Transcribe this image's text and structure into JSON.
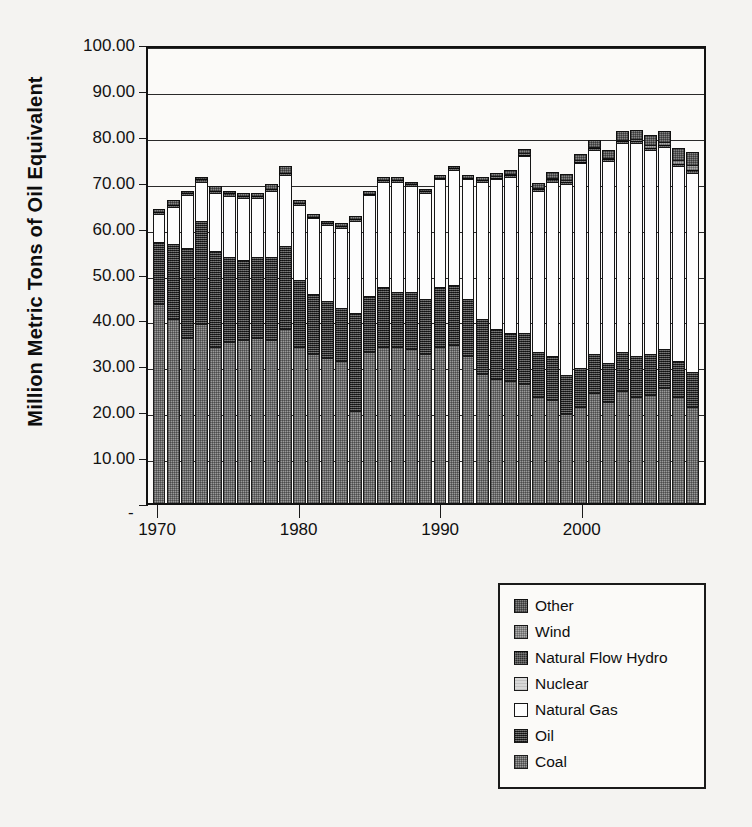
{
  "chart_data": {
    "type": "bar",
    "title": "",
    "subtitle": "",
    "stacked": true,
    "xlabel": "",
    "ylabel": "Million Metric Tons of Oil Equivalent",
    "ylim": [
      0,
      100
    ],
    "ytick_labels": [
      "100.00",
      "90.00",
      "80.00",
      "70.00",
      "60.00",
      "50.00",
      "40.00",
      "30.00",
      "20.00",
      "10.00",
      "-"
    ],
    "ytick_values": [
      100,
      90,
      80,
      70,
      60,
      50,
      40,
      30,
      20,
      10,
      0
    ],
    "grid": "horizontal",
    "legend_position": "below-right",
    "xtick_labels": [
      "1970",
      "1980",
      "1990",
      "2000"
    ],
    "xtick_values": [
      1970,
      1980,
      1990,
      2000
    ],
    "categories": [
      1970,
      1971,
      1972,
      1973,
      1974,
      1975,
      1976,
      1977,
      1978,
      1979,
      1980,
      1981,
      1982,
      1983,
      1984,
      1985,
      1986,
      1987,
      1988,
      1989,
      1990,
      1991,
      1992,
      1993,
      1994,
      1995,
      1996,
      1997,
      1998,
      1999,
      2000,
      2001,
      2002,
      2003,
      2004,
      2005,
      2006,
      2007,
      2008
    ],
    "series": [
      {
        "name": "Coal",
        "color": "#9a9a9a",
        "values": [
          43.4,
          40.0,
          36.0,
          39.0,
          34.0,
          35.0,
          35.5,
          36.0,
          35.5,
          38.0,
          34.0,
          32.5,
          31.5,
          31.0,
          20.0,
          33.0,
          34.0,
          34.0,
          33.5,
          32.5,
          34.0,
          34.5,
          32.0,
          28.0,
          27.0,
          26.5,
          26.0,
          23.0,
          22.5,
          19.5,
          21.0,
          24.0,
          22.0,
          24.5,
          23.0,
          23.5,
          25.0,
          23.0,
          21.0
        ]
      },
      {
        "name": "Oil",
        "color": "#4a4a4a",
        "values": [
          13.5,
          16.5,
          19.5,
          22.5,
          21.0,
          18.5,
          17.5,
          17.5,
          18.0,
          18.0,
          14.5,
          13.0,
          12.5,
          11.5,
          21.5,
          12.0,
          13.0,
          12.0,
          12.5,
          12.0,
          13.0,
          13.0,
          12.5,
          12.0,
          11.0,
          10.5,
          11.0,
          10.0,
          9.5,
          8.5,
          8.5,
          8.5,
          8.5,
          8.5,
          9.0,
          9.0,
          8.5,
          8.0,
          7.5
        ]
      },
      {
        "name": "Natural Gas",
        "color": "#fdfdfd",
        "values": [
          6.0,
          8.0,
          11.5,
          8.5,
          12.5,
          13.5,
          13.5,
          13.0,
          14.5,
          15.5,
          16.5,
          16.5,
          16.5,
          17.5,
          20.0,
          22.0,
          23.0,
          24.0,
          23.0,
          23.0,
          23.5,
          25.0,
          26.0,
          30.0,
          32.5,
          34.0,
          38.5,
          35.0,
          38.0,
          41.5,
          44.5,
          44.5,
          44.0,
          45.5,
          46.5,
          44.5,
          44.0,
          42.5,
          43.5
        ]
      },
      {
        "name": "Nuclear",
        "color": "#d8d8d8",
        "values": [
          0.0,
          0.0,
          0.0,
          0.0,
          0.0,
          0.0,
          0.0,
          0.0,
          0.0,
          0.0,
          0.0,
          0.0,
          0.0,
          0.0,
          0.0,
          0.0,
          0.0,
          0.0,
          0.0,
          0.0,
          0.0,
          0.0,
          0.0,
          0.0,
          0.0,
          0.0,
          0.0,
          0.0,
          0.0,
          0.0,
          0.0,
          0.0,
          0.0,
          0.0,
          0.0,
          0.0,
          0.0,
          0.0,
          0.0
        ]
      },
      {
        "name": "Natural Flow Hydro",
        "color": "#2c2c2c",
        "values": [
          0.5,
          0.5,
          0.5,
          0.5,
          0.5,
          0.5,
          0.4,
          0.5,
          0.5,
          0.5,
          0.4,
          0.4,
          0.4,
          0.4,
          0.4,
          0.4,
          0.4,
          0.4,
          0.4,
          0.4,
          0.4,
          0.4,
          0.4,
          0.4,
          0.4,
          0.4,
          0.3,
          0.4,
          0.5,
          0.5,
          0.4,
          0.3,
          0.4,
          0.3,
          0.4,
          0.4,
          0.4,
          0.4,
          0.5
        ]
      },
      {
        "name": "Wind",
        "color": "#adadad",
        "values": [
          0.0,
          0.0,
          0.0,
          0.0,
          0.0,
          0.0,
          0.0,
          0.0,
          0.0,
          0.0,
          0.0,
          0.0,
          0.0,
          0.0,
          0.0,
          0.0,
          0.0,
          0.0,
          0.0,
          0.0,
          0.0,
          0.0,
          0.0,
          0.0,
          0.1,
          0.1,
          0.1,
          0.1,
          0.2,
          0.2,
          0.2,
          0.2,
          0.3,
          0.3,
          0.4,
          0.5,
          0.7,
          0.9,
          1.2
        ]
      },
      {
        "name": "Other",
        "color": "#848484",
        "values": [
          0.6,
          1.0,
          0.5,
          0.5,
          1.0,
          0.5,
          0.6,
          0.5,
          1.0,
          1.5,
          0.6,
          0.6,
          0.6,
          0.6,
          0.6,
          0.6,
          0.6,
          0.6,
          0.6,
          0.6,
          0.6,
          0.6,
          0.6,
          0.6,
          0.7,
          0.8,
          0.9,
          1.0,
          1.2,
          1.3,
          1.4,
          1.5,
          1.6,
          1.8,
          2.0,
          2.2,
          2.4,
          2.6,
          2.8
        ]
      }
    ],
    "stack_order_bottom_to_top": [
      "Coal",
      "Oil",
      "Natural Gas",
      "Nuclear",
      "Natural Flow Hydro",
      "Wind",
      "Other"
    ],
    "totals": [
      64.0,
      66.0,
      68.0,
      71.0,
      69.0,
      68.0,
      67.5,
      67.5,
      69.5,
      73.5,
      66.0,
      63.0,
      61.5,
      61.0,
      62.5,
      68.0,
      71.0,
      71.0,
      70.0,
      68.5,
      71.5,
      73.5,
      71.5,
      71.0,
      71.7,
      72.3,
      76.8,
      69.5,
      71.9,
      71.5,
      76.0,
      79.0,
      76.8,
      80.9,
      81.3,
      80.1,
      81.0,
      77.4,
      76.5
    ]
  },
  "legend": {
    "items": [
      {
        "label": "Other",
        "swatch": "other-swatch"
      },
      {
        "label": "Wind",
        "swatch": "wind-swatch"
      },
      {
        "label": "Natural Flow Hydro",
        "swatch": "hydro-swatch"
      },
      {
        "label": "Nuclear",
        "swatch": "nuclear-swatch"
      },
      {
        "label": "Natural Gas",
        "swatch": "gas-swatch"
      },
      {
        "label": "Oil",
        "swatch": "oil-swatch"
      },
      {
        "label": "Coal",
        "swatch": "coal-swatch"
      }
    ]
  },
  "axes": {
    "y_title": "Million Metric Tons of Oil Equivalent",
    "y_ticks": [
      "100.00",
      "90.00",
      "80.00",
      "70.00",
      "60.00",
      "50.00",
      "40.00",
      "30.00",
      "20.00",
      "10.00"
    ],
    "y_zero_label": "-",
    "x_ticks": [
      "1970",
      "1980",
      "1990",
      "2000"
    ]
  },
  "caption": {
    "text": ""
  }
}
